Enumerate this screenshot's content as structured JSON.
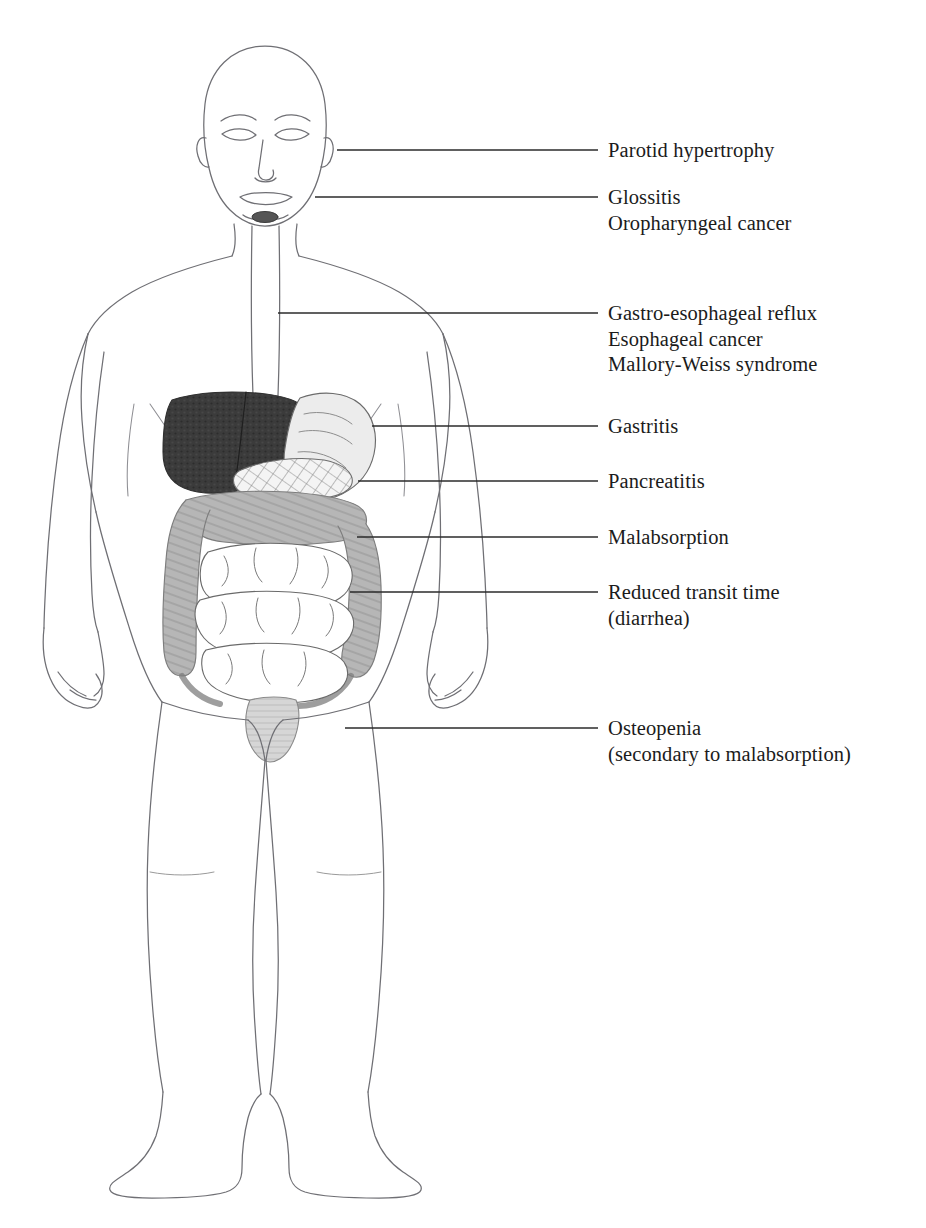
{
  "figure": {
    "caption_truncated": ""
  },
  "colors": {
    "outline": "#6f6f74",
    "leader_line": "#2b2b2b",
    "text": "#1b1b1b",
    "liver": "#3a3a3a",
    "stomach": "#e8e8e8",
    "pancreas": "#f2f2f2",
    "colon": "#b0b0b0",
    "small_intestine": "#ffffff",
    "background": "#ffffff"
  },
  "organs": [
    {
      "name": "liver",
      "shading": "dark-stipple"
    },
    {
      "name": "stomach",
      "shading": "light-gray"
    },
    {
      "name": "pancreas",
      "shading": "cross-hatch"
    },
    {
      "name": "colon",
      "shading": "medium-gray-haustra"
    },
    {
      "name": "small-intestine",
      "shading": "white-outline"
    },
    {
      "name": "esophagus",
      "shading": "white-outline"
    },
    {
      "name": "rectum",
      "shading": "light-gray"
    }
  ],
  "labels": [
    {
      "id": "parotid",
      "lines": [
        "Parotid hypertrophy"
      ],
      "target": "parotid-gland",
      "leader": {
        "x1": 337,
        "x2": 598,
        "y": 150
      },
      "text_x": 608,
      "text_y": 138
    },
    {
      "id": "glossitis",
      "lines": [
        "Glossitis",
        "Oropharyngeal cancer"
      ],
      "target": "mouth-oropharynx",
      "leader": {
        "x1": 315,
        "x2": 598,
        "y": 197
      },
      "text_x": 608,
      "text_y": 185
    },
    {
      "id": "esophagus",
      "lines": [
        "Gastro-esophageal reflux",
        "Esophageal cancer",
        "Mallory-Weiss syndrome"
      ],
      "target": "esophagus",
      "leader": {
        "x1": 278,
        "x2": 598,
        "y": 313
      },
      "text_x": 608,
      "text_y": 301
    },
    {
      "id": "gastritis",
      "lines": [
        "Gastritis"
      ],
      "target": "stomach",
      "leader": {
        "x1": 372,
        "x2": 598,
        "y": 426
      },
      "text_x": 608,
      "text_y": 414
    },
    {
      "id": "pancreatitis",
      "lines": [
        "Pancreatitis"
      ],
      "target": "pancreas",
      "leader": {
        "x1": 358,
        "x2": 598,
        "y": 481
      },
      "text_x": 608,
      "text_y": 469
    },
    {
      "id": "malabsorption",
      "lines": [
        "Malabsorption"
      ],
      "target": "small-intestine",
      "leader": {
        "x1": 357,
        "x2": 598,
        "y": 537
      },
      "text_x": 608,
      "text_y": 525
    },
    {
      "id": "transit",
      "lines": [
        "Reduced transit time",
        "(diarrhea)"
      ],
      "target": "colon",
      "leader": {
        "x1": 350,
        "x2": 598,
        "y": 592
      },
      "text_x": 608,
      "text_y": 580
    },
    {
      "id": "osteopenia",
      "lines": [
        "Osteopenia",
        "(secondary to malabsorption)"
      ],
      "target": "skeleton-pelvis-femur",
      "leader": {
        "x1": 345,
        "x2": 598,
        "y": 728
      },
      "text_x": 608,
      "text_y": 716
    }
  ]
}
